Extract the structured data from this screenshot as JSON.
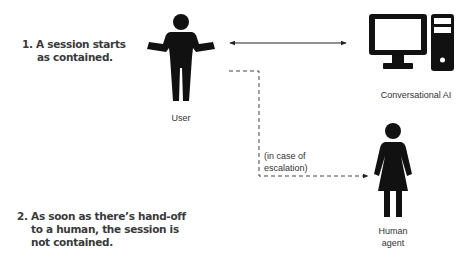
{
  "notes": [
    {
      "lines": [
        "1. A session starts",
        "as contained."
      ]
    },
    {
      "lines": [
        "2. As soon as there’s hand-off",
        "to a human, the session is",
        "not contained."
      ]
    }
  ],
  "actors": {
    "user": {
      "label": "User",
      "icon": "person-icon"
    },
    "ai": {
      "label": "Conversational AI",
      "icon": "computer-icon"
    },
    "human_agent": {
      "label_lines": [
        "Human",
        "agent"
      ],
      "icon": "woman-icon"
    }
  },
  "connectors": {
    "user_ai": {
      "style": "solid",
      "direction": "bidirectional"
    },
    "escalation": {
      "style": "dashed",
      "direction": "to-human-agent",
      "label_lines": [
        "(in case of",
        "escalation)"
      ]
    }
  },
  "colors": {
    "ink": "#111111",
    "text": "#333333",
    "line": "#222222"
  }
}
